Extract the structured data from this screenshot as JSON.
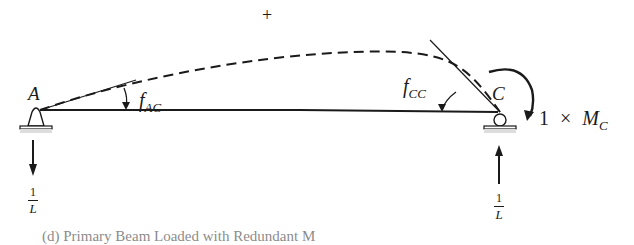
{
  "diagram": {
    "sign": "+",
    "supports": {
      "left": {
        "label": "A",
        "type": "pin"
      },
      "right": {
        "label": "C",
        "type": "roller"
      }
    },
    "angles": {
      "left": {
        "symbol": "f",
        "subscript": "AC"
      },
      "right": {
        "symbol": "f",
        "subscript": "CC"
      }
    },
    "moment": {
      "coefficient": "1",
      "times": "×",
      "symbol": "M",
      "subscript": "C"
    },
    "reactions": {
      "left": {
        "direction": "down",
        "numerator": "1",
        "denominator": "L"
      },
      "right": {
        "direction": "up",
        "numerator": "1",
        "denominator": "L"
      }
    },
    "colors": {
      "ink": "#1a1a1a",
      "background": "#ffffff"
    }
  },
  "caption": "(d) Primary Beam Loaded with Redundant M"
}
